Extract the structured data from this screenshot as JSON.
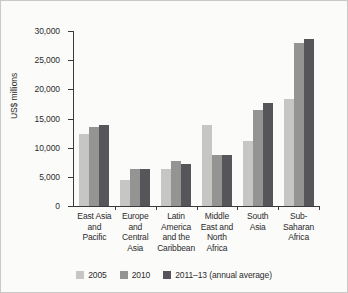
{
  "chart_data": {
    "type": "bar",
    "title": "",
    "subtitle": "",
    "xlabel": "",
    "ylabel": "US$ millions",
    "ylim": [
      0,
      30000
    ],
    "ytick_labels": [
      "30,000",
      "25,000",
      "20,000",
      "15,000",
      "10,000",
      "5,000",
      "0"
    ],
    "ytick_values": [
      30000,
      25000,
      20000,
      15000,
      10000,
      5000,
      0
    ],
    "grid": false,
    "legend_position": "bottom",
    "categories": [
      "East Asia and Pacific",
      "Europe and Central Asia",
      "Latin America and the Caribbean",
      "Middle East and North Africa",
      "South Asia",
      "Sub-Saharan Africa"
    ],
    "category_label_lines": [
      [
        "East Asia",
        "and",
        "Pacific"
      ],
      [
        "Europe",
        "and",
        "Central",
        "Asia"
      ],
      [
        "Latin",
        "America",
        "and the",
        "Caribbean"
      ],
      [
        "Middle",
        "East and",
        "North",
        "Africa"
      ],
      [
        "South",
        "Asia"
      ],
      [
        "Sub-",
        "Saharan",
        "Africa"
      ]
    ],
    "series": [
      {
        "name": "2005",
        "color": "#c6c6c4",
        "values": [
          12400,
          4500,
          6300,
          13900,
          11200,
          18300
        ]
      },
      {
        "name": "2010",
        "color": "#949492",
        "values": [
          13500,
          6400,
          7800,
          8700,
          16400,
          27900
        ]
      },
      {
        "name": "2011–13 (annual average)",
        "color": "#56565a",
        "values": [
          13900,
          6400,
          7200,
          8800,
          17600,
          28700
        ]
      }
    ]
  }
}
